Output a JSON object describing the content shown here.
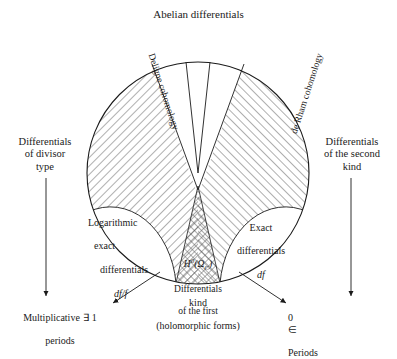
{
  "diagram": {
    "title": "Abelian differentials",
    "regions": {
      "deligne": "Deligne cohomology",
      "de_rham": "de Rham cohomology",
      "logarithmic": {
        "line1": "Logarithmic",
        "line2": "exact",
        "line3": "differentials",
        "line4": "df/f"
      },
      "exact": {
        "line1": "Exact",
        "line2": "differentials",
        "line3": "df"
      },
      "first_kind": {
        "cohomology": "H⁰(Ω_C)",
        "cohomology_base": "H",
        "cohomology_sup": "0",
        "cohomology_paren_open": "(Ω",
        "cohomology_sub": "C",
        "cohomology_paren_close": ")",
        "line1": "Differentials",
        "line2": "of the first",
        "line3": "kind",
        "line4": "(holomorphic forms)"
      }
    },
    "side_labels": {
      "left": "Differentials\nof divisor\ntype",
      "right": "Differentials\nof the second\nkind"
    },
    "outcomes": {
      "multiplicative_line1": "Multiplicative",
      "multiplicative_line2": "periods",
      "multiplicative_symbol": "∃",
      "multiplicative_value": "1",
      "zero_symbol": "0",
      "membership_symbol": "∈",
      "periods": "Periods"
    },
    "colors": {
      "stroke": "#1a1a1a",
      "hatch": "#555555",
      "background": "#ffffff"
    }
  }
}
